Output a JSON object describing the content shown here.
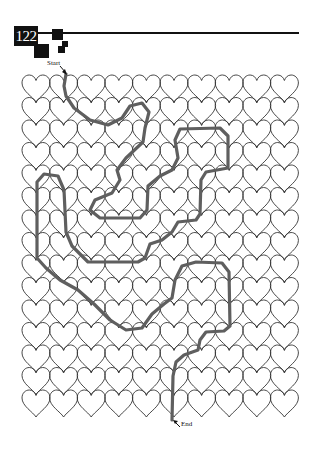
{
  "page": {
    "number": "122"
  },
  "maze": {
    "type": "heart-tile maze",
    "start_label": "Start",
    "end_label": "End",
    "grid": {
      "columns": 10,
      "rows": 15,
      "origin_x": 22,
      "origin_y": 75,
      "cell_width": 27.6,
      "row_pitch": 22.5,
      "heart_size": 28
    },
    "colors": {
      "heart_stroke": "#333333",
      "path_stroke": "#5f5f5f",
      "header": "#111111"
    },
    "solution_path": [
      [
        66,
        74
      ],
      [
        64,
        86
      ],
      [
        66,
        96
      ],
      [
        74,
        108
      ],
      [
        90,
        120
      ],
      [
        108,
        125
      ],
      [
        122,
        118
      ],
      [
        130,
        106
      ],
      [
        142,
        103
      ],
      [
        149,
        112
      ],
      [
        145,
        128
      ],
      [
        143,
        142
      ],
      [
        126,
        158
      ],
      [
        117,
        170
      ],
      [
        120,
        180
      ],
      [
        112,
        193
      ],
      [
        95,
        200
      ],
      [
        90,
        210
      ],
      [
        100,
        218
      ],
      [
        140,
        218
      ],
      [
        147,
        210
      ],
      [
        148,
        186
      ],
      [
        160,
        176
      ],
      [
        172,
        170
      ],
      [
        178,
        158
      ],
      [
        175,
        140
      ],
      [
        180,
        129
      ],
      [
        220,
        128
      ],
      [
        228,
        136
      ],
      [
        228,
        168
      ],
      [
        206,
        172
      ],
      [
        201,
        180
      ],
      [
        200,
        214
      ],
      [
        196,
        220
      ],
      [
        178,
        222
      ],
      [
        172,
        232
      ],
      [
        162,
        240
      ],
      [
        150,
        244
      ],
      [
        145,
        258
      ],
      [
        138,
        262
      ],
      [
        88,
        262
      ],
      [
        72,
        246
      ],
      [
        66,
        232
      ],
      [
        64,
        190
      ],
      [
        58,
        176
      ],
      [
        44,
        174
      ],
      [
        37,
        182
      ],
      [
        37,
        258
      ],
      [
        46,
        268
      ],
      [
        60,
        280
      ],
      [
        78,
        290
      ],
      [
        94,
        304
      ],
      [
        110,
        320
      ],
      [
        126,
        330
      ],
      [
        142,
        328
      ],
      [
        152,
        314
      ],
      [
        164,
        304
      ],
      [
        172,
        298
      ],
      [
        175,
        280
      ],
      [
        182,
        266
      ],
      [
        196,
        262
      ],
      [
        222,
        263
      ],
      [
        229,
        272
      ],
      [
        230,
        326
      ],
      [
        224,
        331
      ],
      [
        206,
        332
      ],
      [
        200,
        340
      ],
      [
        198,
        350
      ],
      [
        184,
        355
      ],
      [
        176,
        362
      ],
      [
        173,
        376
      ],
      [
        172,
        420
      ]
    ]
  }
}
